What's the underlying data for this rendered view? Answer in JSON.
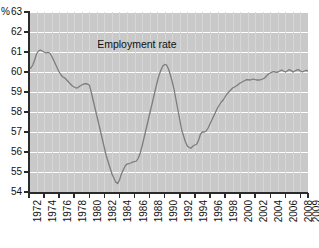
{
  "chart_data": {
    "type": "line",
    "title": "",
    "xlabel": "",
    "ylabel": "%",
    "unit_label": "%",
    "grid": true,
    "legend_position": "none",
    "xlim": [
      1972,
      2009
    ],
    "ylim": [
      54,
      63
    ],
    "y_ticks": [
      54,
      55,
      56,
      57,
      58,
      59,
      60,
      61,
      62,
      63
    ],
    "y_tick_labels": [
      "54",
      "55",
      "56",
      "57",
      "58",
      "59",
      "60",
      "61",
      "62",
      "63"
    ],
    "x_ticks": [
      1972,
      1974,
      1976,
      1978,
      1980,
      1982,
      1984,
      1986,
      1988,
      1990,
      1992,
      1994,
      1996,
      1998,
      2000,
      2002,
      2004,
      2006,
      2008,
      2009
    ],
    "x_tick_labels": [
      "1972",
      "1974",
      "1976",
      "1978",
      "1980",
      "1982",
      "1984",
      "1986",
      "1988",
      "1990",
      "1992",
      "1994",
      "1996",
      "1998",
      "2000",
      "2002",
      "2004",
      "2006",
      "2008",
      "2009"
    ],
    "annotations": [
      {
        "text": "Employment rate",
        "x": 1986.3,
        "y": 61.35
      }
    ],
    "colors": {
      "line": "#7d7d7d",
      "plot_background": "#c9c9c9",
      "gridline": "#ffffff",
      "vertical_gridline": "#d6d6d6",
      "axis": "#2b2b2b",
      "text": "#111111"
    },
    "series": [
      {
        "name": "Employment rate",
        "color": "#7d7d7d",
        "x": [
          1972.0,
          1972.25,
          1972.5,
          1972.75,
          1973.0,
          1973.25,
          1973.5,
          1973.75,
          1974.0,
          1974.25,
          1974.5,
          1974.75,
          1975.0,
          1975.25,
          1975.5,
          1975.75,
          1976.0,
          1976.25,
          1976.5,
          1976.75,
          1977.0,
          1977.25,
          1977.5,
          1977.75,
          1978.0,
          1978.25,
          1978.5,
          1978.75,
          1979.0,
          1979.25,
          1979.5,
          1979.75,
          1980.0,
          1980.25,
          1980.5,
          1980.75,
          1981.0,
          1981.25,
          1981.5,
          1981.75,
          1982.0,
          1982.25,
          1982.5,
          1982.75,
          1983.0,
          1983.25,
          1983.5,
          1983.75,
          1984.0,
          1984.25,
          1984.5,
          1984.75,
          1985.0,
          1985.25,
          1985.5,
          1985.75,
          1986.0,
          1986.25,
          1986.5,
          1986.75,
          1987.0,
          1987.25,
          1987.5,
          1987.75,
          1988.0,
          1988.25,
          1988.5,
          1988.75,
          1989.0,
          1989.25,
          1989.5,
          1989.75,
          1990.0,
          1990.25,
          1990.5,
          1990.75,
          1991.0,
          1991.25,
          1991.5,
          1991.75,
          1992.0,
          1992.25,
          1992.5,
          1992.75,
          1993.0,
          1993.25,
          1993.5,
          1993.75,
          1994.0,
          1994.25,
          1994.5,
          1994.75,
          1995.0,
          1995.25,
          1995.5,
          1995.75,
          1996.0,
          1996.25,
          1996.5,
          1996.75,
          1997.0,
          1997.25,
          1997.5,
          1997.75,
          1998.0,
          1998.25,
          1998.5,
          1998.75,
          1999.0,
          1999.25,
          1999.5,
          1999.75,
          2000.0,
          2000.25,
          2000.5,
          2000.75,
          2001.0,
          2001.25,
          2001.5,
          2001.75,
          2002.0,
          2002.25,
          2002.5,
          2002.75,
          2003.0,
          2003.25,
          2003.5,
          2003.75,
          2004.0,
          2004.25,
          2004.5,
          2004.75,
          2005.0,
          2005.25,
          2005.5,
          2005.75,
          2006.0,
          2006.25,
          2006.5,
          2006.75,
          2007.0,
          2007.25,
          2007.5,
          2007.75,
          2008.0,
          2008.25,
          2008.5,
          2008.75,
          2009.0
        ],
        "y": [
          60.2,
          60.2,
          60.35,
          60.6,
          60.9,
          61.05,
          61.1,
          61.05,
          61.0,
          60.95,
          60.98,
          60.95,
          60.8,
          60.6,
          60.4,
          60.2,
          60.0,
          59.85,
          59.75,
          59.7,
          59.6,
          59.5,
          59.4,
          59.3,
          59.25,
          59.2,
          59.22,
          59.3,
          59.35,
          59.4,
          59.42,
          59.4,
          59.35,
          59.0,
          58.6,
          58.2,
          57.8,
          57.4,
          57.0,
          56.6,
          56.2,
          55.8,
          55.5,
          55.2,
          54.9,
          54.7,
          54.5,
          54.42,
          54.6,
          54.9,
          55.1,
          55.3,
          55.4,
          55.42,
          55.45,
          55.5,
          55.52,
          55.55,
          55.7,
          55.95,
          56.3,
          56.7,
          57.1,
          57.5,
          57.9,
          58.3,
          58.7,
          59.1,
          59.5,
          59.85,
          60.1,
          60.3,
          60.38,
          60.35,
          60.15,
          59.85,
          59.5,
          59.1,
          58.6,
          58.1,
          57.6,
          57.1,
          56.8,
          56.5,
          56.3,
          56.22,
          56.2,
          56.3,
          56.35,
          56.4,
          56.6,
          56.9,
          57.0,
          57.0,
          57.05,
          57.2,
          57.4,
          57.6,
          57.8,
          58.0,
          58.2,
          58.35,
          58.5,
          58.6,
          58.75,
          58.9,
          59.0,
          59.1,
          59.2,
          59.25,
          59.3,
          59.38,
          59.45,
          59.5,
          59.55,
          59.6,
          59.62,
          59.6,
          59.62,
          59.65,
          59.62,
          59.6,
          59.6,
          59.62,
          59.65,
          59.7,
          59.8,
          59.9,
          59.95,
          60.0,
          60.02,
          59.98,
          60.0,
          60.05,
          60.1,
          60.05,
          60.0,
          60.05,
          60.12,
          60.08,
          60.0,
          60.05,
          60.1,
          60.12,
          60.05,
          60.0,
          60.05,
          60.08,
          60.05
        ]
      }
    ]
  }
}
